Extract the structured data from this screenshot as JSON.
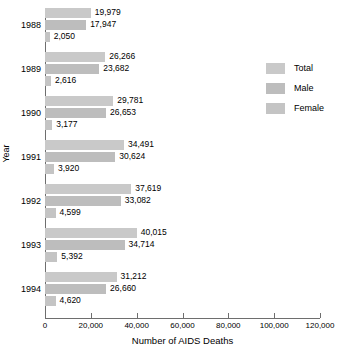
{
  "chart_data": {
    "type": "bar",
    "orientation": "horizontal",
    "title": "",
    "xlabel": "Number of AIDS Deaths",
    "ylabel": "Year",
    "xlim": [
      0,
      120000
    ],
    "xticks": [
      0,
      20000,
      40000,
      60000,
      80000,
      100000,
      120000
    ],
    "xtick_labels": [
      "0",
      "20,000",
      "40,000",
      "60,000",
      "80,000",
      "100,000",
      "120,000"
    ],
    "grid": false,
    "legend_position": "right",
    "categories": [
      "1988",
      "1989",
      "1990",
      "1991",
      "1992",
      "1993",
      "1994"
    ],
    "series": [
      {
        "name": "Total",
        "color": "#c9c9c9",
        "values": [
          19979,
          26266,
          29781,
          34491,
          37619,
          40015,
          31212
        ],
        "value_labels": [
          "19,979",
          "26,266",
          "29,781",
          "34,491",
          "37,619",
          "40,015",
          "31,212"
        ]
      },
      {
        "name": "Male",
        "color": "#bdbdbd",
        "values": [
          17947,
          23682,
          26653,
          30624,
          33082,
          34714,
          26660
        ],
        "value_labels": [
          "17,947",
          "23,682",
          "26,653",
          "30,624",
          "33,082",
          "34,714",
          "26,660"
        ]
      },
      {
        "name": "Female",
        "color": "#c4c4c4",
        "values": [
          2050,
          2616,
          3177,
          3920,
          4599,
          5392,
          4620
        ],
        "value_labels": [
          "2,050",
          "2,616",
          "3,177",
          "3,920",
          "4,599",
          "5,392",
          "4,620"
        ]
      }
    ]
  },
  "legend": {
    "items": [
      {
        "label": "Total"
      },
      {
        "label": "Male"
      },
      {
        "label": "Female"
      }
    ]
  },
  "axis": {
    "x_title": "Number of AIDS Deaths",
    "y_title": "Year"
  },
  "colors": {
    "total": "#c9c9c9",
    "male": "#bdbdbd",
    "female": "#c4c4c4",
    "axis": "#6e6e6e",
    "text": "#000000",
    "background": "#ffffff"
  }
}
